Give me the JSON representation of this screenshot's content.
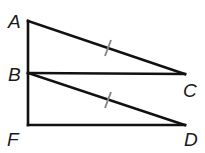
{
  "diagram": {
    "points": {
      "A": {
        "label": "A",
        "x": 28,
        "y": 21
      },
      "B": {
        "label": "B",
        "x": 28,
        "y": 73
      },
      "C": {
        "label": "C",
        "x": 185,
        "y": 74
      },
      "F": {
        "label": "F",
        "x": 28,
        "y": 125
      },
      "D": {
        "label": "D",
        "x": 185,
        "y": 125
      }
    },
    "segments": [
      "AF",
      "AC",
      "BC",
      "BD",
      "FD"
    ],
    "congruent_marks": [
      "AC",
      "BD"
    ],
    "colors": {
      "line": "#111111",
      "tick": "#888888"
    }
  }
}
